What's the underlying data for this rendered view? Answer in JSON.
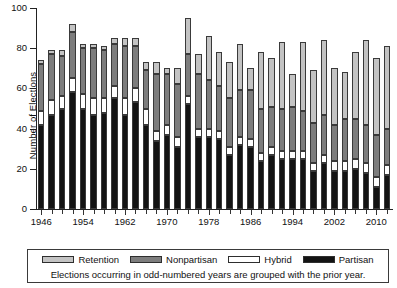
{
  "chart_data": {
    "type": "bar",
    "stacked": true,
    "title": "",
    "xlabel": "",
    "ylabel": "Number of Elections",
    "ylim": [
      0,
      100
    ],
    "yticks": [
      0,
      20,
      40,
      60,
      80,
      100
    ],
    "ytick_labels": [
      "0",
      "20",
      "40",
      "60",
      "80",
      "100"
    ],
    "xtick_labels": [
      "1946",
      "1954",
      "1962",
      "1970",
      "1978",
      "1986",
      "1994",
      "2002",
      "2010"
    ],
    "grid": false,
    "legend_position": "bottom",
    "note": "Elections occurring in odd-numbered years are grouped with the prior year.",
    "categories": [
      "1946",
      "1948",
      "1950",
      "1952",
      "1954",
      "1956",
      "1958",
      "1960",
      "1962",
      "1964",
      "1966",
      "1968",
      "1970",
      "1972",
      "1974",
      "1976",
      "1978",
      "1980",
      "1982",
      "1984",
      "1986",
      "1988",
      "1990",
      "1992",
      "1994",
      "1996",
      "1998",
      "2000",
      "2002",
      "2004",
      "2006",
      "2008",
      "2010",
      "2012"
    ],
    "series": [
      {
        "name": "Partisan",
        "color": "#131313",
        "values": [
          42,
          47,
          50,
          58,
          50,
          47,
          48,
          55,
          47,
          53,
          42,
          34,
          37,
          31,
          52,
          36,
          36,
          35,
          27,
          32,
          31,
          24,
          27,
          25,
          25,
          25,
          19,
          23,
          19,
          19,
          20,
          18,
          11,
          17
        ]
      },
      {
        "name": "Hybrid",
        "color": "#ffffff",
        "values": [
          7,
          7,
          6,
          7,
          7,
          8,
          7,
          6,
          8,
          7,
          8,
          5,
          5,
          5,
          4,
          4,
          4,
          4,
          4,
          4,
          4,
          4,
          4,
          4,
          4,
          4,
          4,
          4,
          5,
          5,
          5,
          5,
          5,
          5
        ]
      },
      {
        "name": "Nonpartisan",
        "color": "#7d7d7d",
        "values": [
          23,
          23,
          20,
          23,
          23,
          25,
          24,
          21,
          26,
          21,
          19,
          28,
          25,
          26,
          21,
          27,
          24,
          22,
          24,
          23,
          24,
          22,
          20,
          21,
          22,
          20,
          20,
          20,
          18,
          21,
          20,
          19,
          21,
          18
        ]
      },
      {
        "name": "Retention",
        "color": "#c3c3c3",
        "values": [
          2,
          2,
          3,
          4,
          2,
          2,
          2,
          3,
          4,
          4,
          4,
          6,
          3,
          8,
          18,
          10,
          22,
          17,
          18,
          23,
          11,
          28,
          24,
          33,
          16,
          34,
          26,
          37,
          28,
          23,
          33,
          42,
          38,
          41
        ]
      }
    ]
  },
  "legend": {
    "items": [
      {
        "label": "Retention",
        "key": "retention"
      },
      {
        "label": "Nonpartisan",
        "key": "nonpartisan"
      },
      {
        "label": "Hybrid",
        "key": "hybrid"
      },
      {
        "label": "Partisan",
        "key": "partisan"
      }
    ],
    "note": "Elections occurring in odd-numbered years are grouped with the prior year."
  },
  "axis": {
    "ylabel": "Number of Elections"
  }
}
